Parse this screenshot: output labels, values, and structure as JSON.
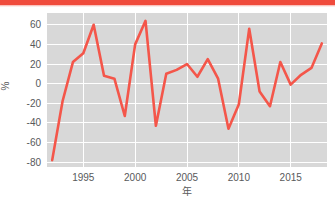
{
  "banner": {
    "color": "#f04b3c"
  },
  "chart_data": {
    "type": "line",
    "title": "",
    "subtitle": "",
    "xlabel": "年",
    "ylabel": "%",
    "xlim": [
      1991.5,
      2018.5
    ],
    "ylim": [
      -85,
      72
    ],
    "grid": true,
    "legend": false,
    "legend_position": "none",
    "plot_background_color": "#d8d8d8",
    "gridline_color": "#ffffff",
    "line_color": "#f4564a",
    "x_tick_labels": [
      "1995",
      "2000",
      "2005",
      "2010",
      "2015"
    ],
    "x_ticks": [
      1995,
      2000,
      2005,
      2010,
      2015
    ],
    "y_tick_labels": [
      "60",
      "40",
      "20",
      "0",
      "-20",
      "-40",
      "-60",
      "-80"
    ],
    "y_ticks": [
      60,
      40,
      20,
      0,
      -20,
      -40,
      -60,
      -80
    ],
    "x": [
      1992,
      1993,
      1994,
      1995,
      1996,
      1997,
      1998,
      1999,
      2000,
      2001,
      2002,
      2003,
      2004,
      2005,
      2006,
      2007,
      2008,
      2009,
      2010,
      2011,
      2012,
      2013,
      2014,
      2015,
      2016,
      2017,
      2018
    ],
    "values": [
      -78,
      -18,
      22,
      31,
      60,
      8,
      5,
      -33,
      40,
      64,
      -43,
      10,
      14,
      20,
      7,
      25,
      5,
      -46,
      -21,
      56,
      -8,
      -23,
      22,
      -1,
      9,
      16,
      41
    ],
    "series": [
      {
        "name": "",
        "color": "#f4564a",
        "values": [
          -78,
          -18,
          22,
          31,
          60,
          8,
          5,
          -33,
          40,
          64,
          -43,
          10,
          14,
          20,
          7,
          25,
          5,
          -46,
          -21,
          56,
          -8,
          -23,
          22,
          -1,
          9,
          16,
          41
        ]
      }
    ]
  }
}
